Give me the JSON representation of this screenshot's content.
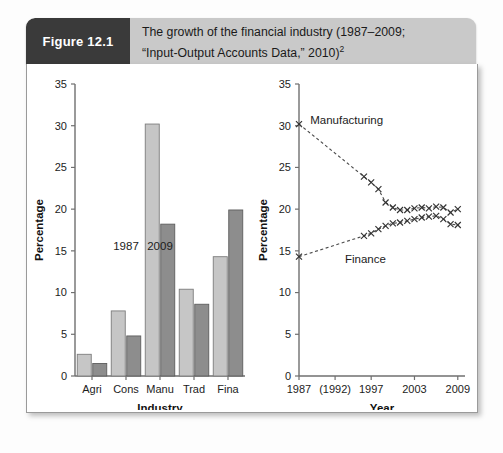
{
  "figure": {
    "badge_label": "Figure 12.1",
    "caption_line1": "The growth of the financial industry (1987–2009;",
    "caption_line2": "“Input-Output Accounts Data,” 2010)",
    "caption_superscript": "2",
    "badge_color": "#3a3a3a",
    "header_color": "#c9c9c9"
  },
  "chart_data": [
    {
      "id": "industry-bars",
      "type": "bar",
      "title": "",
      "xlabel": "Industry",
      "ylabel": "Percentage",
      "categories": [
        "Agri",
        "Cons",
        "Manu",
        "Trad",
        "Fina"
      ],
      "ylim": [
        0,
        35
      ],
      "yticks": [
        0,
        5,
        10,
        15,
        20,
        25,
        30,
        35
      ],
      "grid": false,
      "legend_position": "inline-annotation",
      "annotations": [
        {
          "text": "1987",
          "x_category": "Cons",
          "y_value": 15.1
        },
        {
          "text": "2009",
          "x_category": "Manu",
          "y_value": 15.1
        }
      ],
      "series": [
        {
          "name": "1987",
          "color": "#c6c6c6",
          "values": [
            2.6,
            7.8,
            30.2,
            10.4,
            14.3
          ]
        },
        {
          "name": "2009",
          "color": "#8d8d8d",
          "values": [
            1.5,
            4.8,
            18.2,
            8.6,
            19.9
          ]
        }
      ]
    },
    {
      "id": "year-trends",
      "type": "line",
      "title": "",
      "xlabel": "Year",
      "ylabel": "Percentage",
      "ylim": [
        0,
        35
      ],
      "yticks": [
        0,
        5,
        10,
        15,
        20,
        25,
        30,
        35
      ],
      "xlim": [
        1987,
        2010
      ],
      "xticks": [
        1987,
        1992,
        1997,
        2003,
        2009
      ],
      "xticklabels": [
        "1987",
        "(1992)",
        "1997",
        "2003",
        "2009"
      ],
      "grid": false,
      "marker": "x",
      "linestyle": "dashed",
      "legend_position": "inline-labels",
      "series": [
        {
          "name": "Manufacturing",
          "label_x": 1993.6,
          "label_y": 30.2,
          "x": [
            1987,
            1996,
            1997,
            1998,
            1999,
            2000,
            2001,
            2002,
            2003,
            2004,
            2005,
            2006,
            2007,
            2008,
            2009
          ],
          "y": [
            30.2,
            23.9,
            23.2,
            22.4,
            20.8,
            20.2,
            19.9,
            19.9,
            20.1,
            20.2,
            20.1,
            20.3,
            20.2,
            19.6,
            20.0
          ]
        },
        {
          "name": "Finance",
          "label_x": 1996.2,
          "label_y": 13.5,
          "x": [
            1987,
            1996,
            1997,
            1998,
            1999,
            2000,
            2001,
            2002,
            2003,
            2004,
            2005,
            2006,
            2007,
            2008,
            2009
          ],
          "y": [
            14.3,
            16.8,
            17.1,
            17.6,
            18.0,
            18.3,
            18.4,
            18.6,
            18.8,
            19.0,
            19.1,
            19.2,
            18.8,
            18.2,
            18.1
          ]
        }
      ]
    }
  ]
}
